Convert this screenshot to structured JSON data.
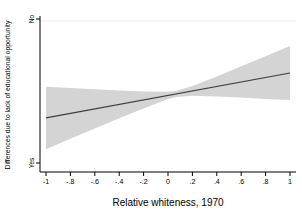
{
  "chart_data": {
    "type": "line",
    "title": "",
    "xlabel": "Relative whiteness, 1970",
    "ylabel": "Differences due to lack of educational opportunity",
    "xlim": [
      -1,
      1
    ],
    "ylim": [
      0,
      1
    ],
    "x_ticks": [
      -1,
      -0.8,
      -0.6,
      -0.4,
      -0.2,
      0,
      0.2,
      0.4,
      0.6,
      0.8,
      1
    ],
    "x_tick_labels": [
      "-1",
      "-.8",
      "-.6",
      "-.4",
      "-.2",
      "0",
      ".2",
      ".4",
      ".6",
      ".8",
      "1"
    ],
    "y_ticks": [
      {
        "value": 1,
        "label": "No"
      },
      {
        "value": 0,
        "label": "Yes"
      }
    ],
    "grid": "single faint horizontal gridline at top (No level)",
    "legend": "none",
    "series": [
      {
        "name": "linear-fit",
        "type": "line",
        "color": "#3d3d3d",
        "x": [
          -1,
          1
        ],
        "y": [
          0.313,
          0.625
        ]
      },
      {
        "name": "confidence-band-95",
        "type": "band",
        "color": "#d4d4d4",
        "points_x_lo_hi": [
          [
            -1,
            0.096,
            0.529
          ],
          [
            -0.8,
            0.168,
            0.52
          ],
          [
            -0.6,
            0.239,
            0.512
          ],
          [
            -0.4,
            0.31,
            0.504
          ],
          [
            -0.2,
            0.379,
            0.496
          ],
          [
            0,
            0.444,
            0.494
          ],
          [
            0.07,
            0.459,
            0.501
          ],
          [
            0.2,
            0.467,
            0.534
          ],
          [
            0.4,
            0.462,
            0.601
          ],
          [
            0.6,
            0.454,
            0.672
          ],
          [
            0.8,
            0.445,
            0.742
          ],
          [
            1,
            0.437,
            0.813
          ]
        ]
      }
    ]
  },
  "colors": {
    "background": "#ffffff",
    "axis": "#000000",
    "band": "#d4d4d4",
    "fit_line": "#3d3d3d",
    "gridline": "#ececec",
    "text": "#000000"
  }
}
